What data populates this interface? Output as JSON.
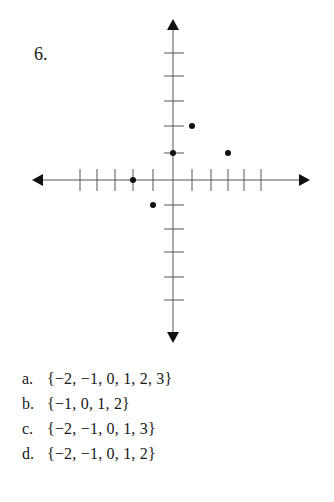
{
  "question": {
    "number": "6.",
    "choices": [
      {
        "letter": "a.",
        "text": "{−2, −1, 0, 1, 2, 3}"
      },
      {
        "letter": "b.",
        "text": "{−1, 0, 1, 2}"
      },
      {
        "letter": "c.",
        "text": "{−2, −1, 0, 1, 3}"
      },
      {
        "letter": "d.",
        "text": "{−2, −1, 0, 1, 2}"
      }
    ]
  },
  "chart_data": {
    "type": "scatter",
    "title": "",
    "xlabel": "",
    "ylabel": "",
    "xlim": [
      -5,
      5
    ],
    "ylim": [
      -5,
      5
    ],
    "grid": false,
    "tick_marks_unlabeled": true,
    "points": [
      {
        "x": -2,
        "y": 0
      },
      {
        "x": -1,
        "y": -1
      },
      {
        "x": 0,
        "y": 1
      },
      {
        "x": 1,
        "y": 2
      },
      {
        "x": 3,
        "y": 1
      }
    ]
  }
}
